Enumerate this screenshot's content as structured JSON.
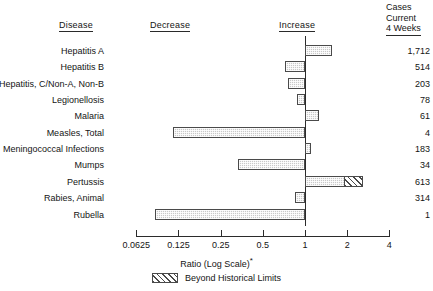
{
  "header": {
    "disease": "Disease",
    "decrease": "Decrease",
    "increase": "Increase",
    "cases_line1": "Cases",
    "cases_line2": "Current",
    "cases_line3": "4 Weeks"
  },
  "axis": {
    "title": "Ratio (Log Scale)",
    "title_marker": "*"
  },
  "legend": {
    "label": "Beyond Historical Limits"
  },
  "chart_data": {
    "type": "bar",
    "orientation": "horizontal",
    "title": "",
    "xlabel": "Ratio (Log Scale)*",
    "ylabel": "Disease",
    "xscale": "log",
    "xlim": [
      0.0625,
      4
    ],
    "xticks": [
      0.0625,
      0.125,
      0.25,
      0.5,
      1,
      2,
      4
    ],
    "xticklabels": [
      "0.0625",
      "0.125",
      "0.25",
      "0.5",
      "1",
      "2",
      "4"
    ],
    "reference_line": 1,
    "grid": false,
    "legend_position": "bottom-center",
    "legend_entries": [
      "Beyond Historical Limits"
    ],
    "categories": [
      "Hepatitis A",
      "Hepatitis B",
      "Hepatitis, C/Non-A, Non-B",
      "Legionellosis",
      "Malaria",
      "Measles, Total",
      "Meningococcal Infections",
      "Mumps",
      "Pertussis",
      "Rabies, Animal",
      "Rubella"
    ],
    "values": [
      1.55,
      0.72,
      0.76,
      0.87,
      1.25,
      0.115,
      1.1,
      0.33,
      2.6,
      0.85,
      0.085
    ],
    "beyond_historical_limits_from": [
      null,
      null,
      null,
      null,
      null,
      null,
      null,
      null,
      1.9,
      null,
      null
    ],
    "cases_current_4_weeks": [
      "1,712",
      "514",
      "203",
      "78",
      "61",
      "4",
      "183",
      "34",
      "613",
      "314",
      "1"
    ]
  }
}
